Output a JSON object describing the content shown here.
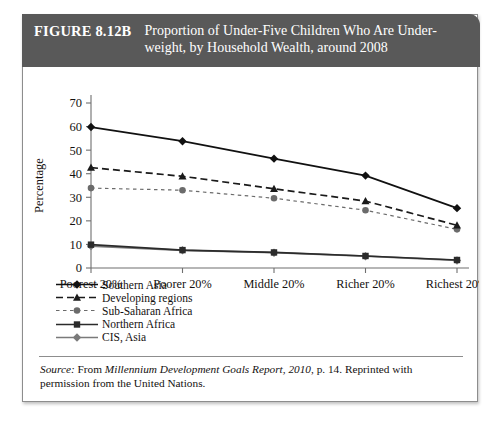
{
  "figure": {
    "number": "FIGURE 8.12B",
    "title_line1": "Proportion of Under-Five Children Who Are Under-",
    "title_line2": "weight, by Household Wealth, around 2008",
    "header_color": "#595959"
  },
  "source": {
    "label": "Source:",
    "text_before": " From ",
    "italic_title": "Millennium Development Goals Report, 2010",
    "text_after": ", p. 14. Reprinted with permission from the United Nations."
  },
  "chart_data": {
    "type": "line",
    "xlabel": "",
    "ylabel": "Percentage",
    "categories": [
      "Poorest 20%",
      "Poorer 20%",
      "Middle 20%",
      "Richer 20%",
      "Richest 20%"
    ],
    "ylim": [
      0,
      70
    ],
    "yticks": [
      0,
      10,
      20,
      30,
      40,
      50,
      60,
      70
    ],
    "grid": false,
    "legend_position": "below-left",
    "series": [
      {
        "name": "Southern Asia",
        "values": [
          59.8,
          53.8,
          46.4,
          39.2,
          25.4
        ],
        "marker": "diamond",
        "line_style": "solid",
        "color": "#111111"
      },
      {
        "name": "Developing regions",
        "values": [
          42.6,
          38.9,
          33.6,
          28.4,
          18.1
        ],
        "marker": "triangle",
        "line_style": "dashed",
        "color": "#1a1a1a"
      },
      {
        "name": "Sub-Saharan Africa",
        "values": [
          33.9,
          33.0,
          29.6,
          24.5,
          16.4
        ],
        "marker": "circle",
        "line_style": "fine-dashed",
        "color": "#6b6b6b"
      },
      {
        "name": "Northern Africa",
        "values": [
          9.9,
          7.6,
          6.6,
          5.1,
          3.4
        ],
        "marker": "square",
        "line_style": "solid",
        "color": "#2b2b2b"
      },
      {
        "name": "CIS, Asia",
        "values": [
          9.3,
          7.5,
          6.5,
          5.0,
          3.2
        ],
        "marker": "diamond",
        "line_style": "solid",
        "color": "#7a7a7a"
      }
    ]
  }
}
